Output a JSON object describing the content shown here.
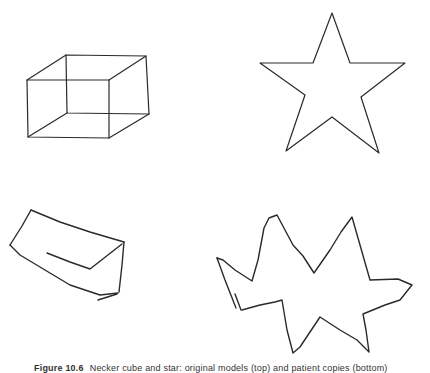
{
  "figure": {
    "caption_label": "Figure 10.6",
    "caption_text": "Necker cube and star: original models (top) and patient copies (bottom)",
    "stroke_color": "#2a2a2a",
    "background": "#ffffff",
    "panels": [
      {
        "name": "model-cube",
        "role": "original model",
        "shape": "wireframe cube",
        "paths": [
          "M27,80 L109,80 L109,138 L28,137 Z",
          "M66,55 L146,56 L149,114 L67,113 Z",
          "M27,80 L66,55",
          "M109,80 L146,56",
          "M109,138 L149,114",
          "M28,137 L67,113"
        ]
      },
      {
        "name": "model-star",
        "role": "original model",
        "shape": "five-pointed star",
        "paths": [
          "M332,13 L350,63 L405,63 L361,97 L379,153 L332,117 L286,151 L305,95 L260,63 L313,63 Z"
        ]
      },
      {
        "name": "copy-cube",
        "role": "hand-drawn copy",
        "shape": "distorted cube drawing",
        "paths": [
          "M31,210 L60,222 L90,232 L124,242",
          "M31,210 L22,226 L10,245",
          "M10,245 L20,255 L45,270 L70,285 L100,295 L118,293",
          "M124,242 L122,265 L119,292",
          "M47,253 L70,262 L90,269 L122,244",
          "M117,294 L98,300"
        ]
      },
      {
        "name": "copy-star",
        "role": "hand-drawn copy",
        "shape": "distorted star drawing",
        "paths": [
          "M217,258 L223,260 L235,270 L252,281 L258,260 L264,228 L269,218 L277,215 L293,245 L303,256 L314,273 L330,250 L341,232 L352,217 L360,245 L370,280 L398,279 L412,285 L400,300 L385,305 L363,314 L366,330 L369,352 L357,340 L340,330 L320,317 L300,347 L293,353 L287,330 L282,300 L275,302 L260,305 L242,310",
          "M217,258 L225,280 L236,308",
          "M235,294 L238,302 L241,310"
        ]
      }
    ]
  }
}
